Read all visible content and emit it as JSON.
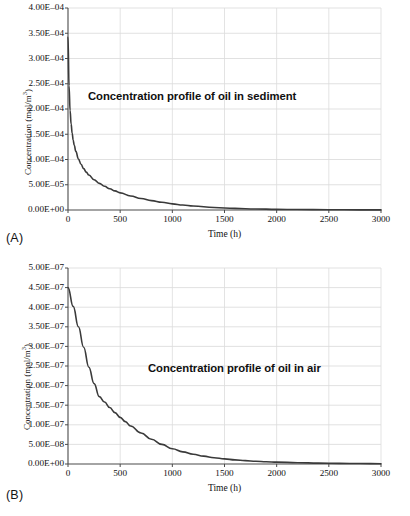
{
  "figure": {
    "panels": [
      {
        "panel_label": "(A)",
        "annotation": "Concentration profile of oil in sediment",
        "y_axis_title_main": "Concentration (mol/m",
        "y_axis_title_sup": "3",
        "y_axis_title_close": ")",
        "x_axis_title": "Time (h)"
      },
      {
        "panel_label": "(B)",
        "annotation": "Concentration profile of oil in air",
        "y_axis_title_main": "Concentration (mol/m",
        "y_axis_title_sup": "3",
        "y_axis_title_close": ")",
        "x_axis_title": "Time (h)"
      }
    ]
  },
  "chart_data": [
    {
      "type": "line",
      "title": "Concentration profile of oil in sediment",
      "panel": "(A)",
      "xlabel": "Time (h)",
      "ylabel": "Concentration (mol/m3)",
      "xlim": [
        0,
        3000
      ],
      "ylim": [
        0,
        0.0004
      ],
      "grid": true,
      "legend": "none",
      "accent_color": "#3a3a3a",
      "xticks": [
        0,
        500,
        1000,
        1500,
        2000,
        2500,
        3000
      ],
      "xtick_labels": [
        "0",
        "500",
        "1000",
        "1500",
        "2000",
        "2500",
        "3000"
      ],
      "yticks": [
        0,
        5e-05,
        0.0001,
        0.00015,
        0.0002,
        0.00025,
        0.0003,
        0.00035,
        0.0004
      ],
      "ytick_labels": [
        "0.00E+00",
        "5.00E-05",
        "1.00E-04",
        "1.50E-04",
        "2.00E-04",
        "2.50E-04",
        "3.00E-04",
        "3.50E-04",
        "4.00E-04"
      ],
      "series": [
        {
          "name": "oil in sediment",
          "x": [
            0,
            10,
            20,
            30,
            40,
            50,
            60,
            75,
            100,
            125,
            150,
            175,
            200,
            250,
            300,
            350,
            400,
            450,
            500,
            600,
            700,
            800,
            900,
            1000,
            1100,
            1200,
            1400,
            1600,
            1800,
            2000,
            2200,
            2500,
            2800,
            3000
          ],
          "y": [
            0.000342,
            0.000246,
            0.000197,
            0.00017,
            0.000152,
            0.000138,
            0.000128,
            0.000116,
            0.000101,
            9.05e-05,
            8.2e-05,
            7.5e-05,
            6.92e-05,
            6e-05,
            5.28e-05,
            4.7e-05,
            4.2e-05,
            3.78e-05,
            3.4e-05,
            2.78e-05,
            2.28e-05,
            1.86e-05,
            1.52e-05,
            1.22e-05,
            9.8e-06,
            7.8e-06,
            5e-06,
            3.2e-06,
            2e-06,
            1.3e-06,
            9e-07,
            5e-07,
            3e-07,
            2e-07
          ]
        }
      ]
    },
    {
      "type": "line",
      "title": "Concentration profile of oil in air",
      "panel": "(B)",
      "xlabel": "Time (h)",
      "ylabel": "Concentration (mol/m3)",
      "xlim": [
        0,
        3000
      ],
      "ylim": [
        0,
        5e-07
      ],
      "grid": true,
      "legend": "none",
      "accent_color": "#3a3a3a",
      "xticks": [
        0,
        500,
        1000,
        1500,
        2000,
        2500,
        3000
      ],
      "xtick_labels": [
        "0",
        "500",
        "1000",
        "1500",
        "2000",
        "2500",
        "3000"
      ],
      "yticks": [
        0,
        5e-08,
        1e-07,
        1.5e-07,
        2e-07,
        2.5e-07,
        3e-07,
        3.5e-07,
        4e-07,
        4.5e-07,
        5e-07
      ],
      "ytick_labels": [
        "0.00E+00",
        "5.00E-08",
        "1.00E-07",
        "1.50E-07",
        "2.00E-07",
        "2.50E-07",
        "3.00E-07",
        "3.50E-07",
        "4.00E-07",
        "4.50E-07",
        "5.00E-07"
      ],
      "series": [
        {
          "name": "oil in air",
          "x": [
            0,
            50,
            100,
            150,
            200,
            250,
            300,
            350,
            400,
            450,
            500,
            550,
            600,
            700,
            800,
            900,
            1000,
            1100,
            1200,
            1300,
            1400,
            1500,
            1600,
            1700,
            1800,
            1900,
            2000,
            2200,
            2400,
            2600,
            2800,
            3000
          ],
          "y": [
            4.5e-07,
            4.02e-07,
            3.5e-07,
            2.98e-07,
            2.47e-07,
            2.05e-07,
            1.72e-07,
            1.58e-07,
            1.44e-07,
            1.31e-07,
            1.19e-07,
            1.08e-07,
            9.7e-08,
            7.9e-08,
            6.3e-08,
            5e-08,
            3.9e-08,
            3.1e-08,
            2.5e-08,
            2e-08,
            1.6e-08,
            1.3e-08,
            1.05e-08,
            8.5e-09,
            7e-09,
            5.8e-09,
            4.8e-09,
            3.3e-09,
            2.3e-09,
            1.6e-09,
            1.1e-09,
            8e-10
          ]
        }
      ]
    }
  ]
}
